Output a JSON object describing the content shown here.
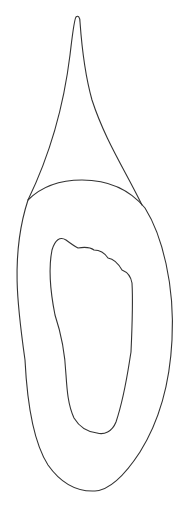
{
  "figure": {
    "stroke_color": "#333333",
    "background_color": "#ffffff",
    "parts": [
      {
        "name": "spire",
        "label": ""
      },
      {
        "name": "outer-oval",
        "label": ""
      },
      {
        "name": "inner-foot",
        "label": ""
      }
    ]
  }
}
